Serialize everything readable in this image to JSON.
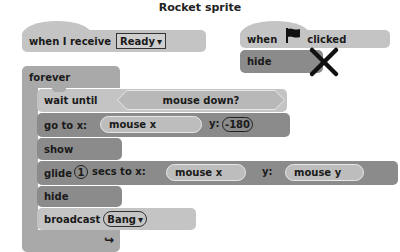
{
  "title": "Rocket sprite",
  "scripts": {
    "receive_script": {
      "hat": {
        "label": "when I receive",
        "message": "Ready",
        "dropdown_glyph": "▾"
      },
      "forever": {
        "label": "forever",
        "loop_arrow_glyph": "↪",
        "blocks": [
          {
            "type": "wait_until",
            "label": "wait until",
            "condition": "mouse down?"
          },
          {
            "type": "go_to",
            "label": "go to x:",
            "x_value": "mouse x",
            "y_label": "y:",
            "y_value": "-180"
          },
          {
            "type": "show",
            "label": "show"
          },
          {
            "type": "glide",
            "label_prefix": "glide",
            "secs": "1",
            "label_mid": "secs to x:",
            "x_value": "mouse x",
            "y_label": "y:",
            "y_value": "mouse y"
          },
          {
            "type": "hide",
            "label": "hide"
          },
          {
            "type": "broadcast",
            "label": "broadcast",
            "message": "Bang",
            "dropdown_glyph": "▾"
          }
        ]
      }
    },
    "flag_script": {
      "hat": {
        "label_prefix": "when",
        "icon": "green-flag-icon",
        "label_suffix": "clicked"
      },
      "blocks": [
        {
          "type": "hide",
          "label": "hide",
          "annotation": "crossed-out (X)"
        }
      ]
    }
  },
  "colors": {
    "light_block": "#c4c4c4",
    "dark_block": "#8b8b8b",
    "control_block": "#a9a9a9",
    "cross_mark": "#111111"
  }
}
